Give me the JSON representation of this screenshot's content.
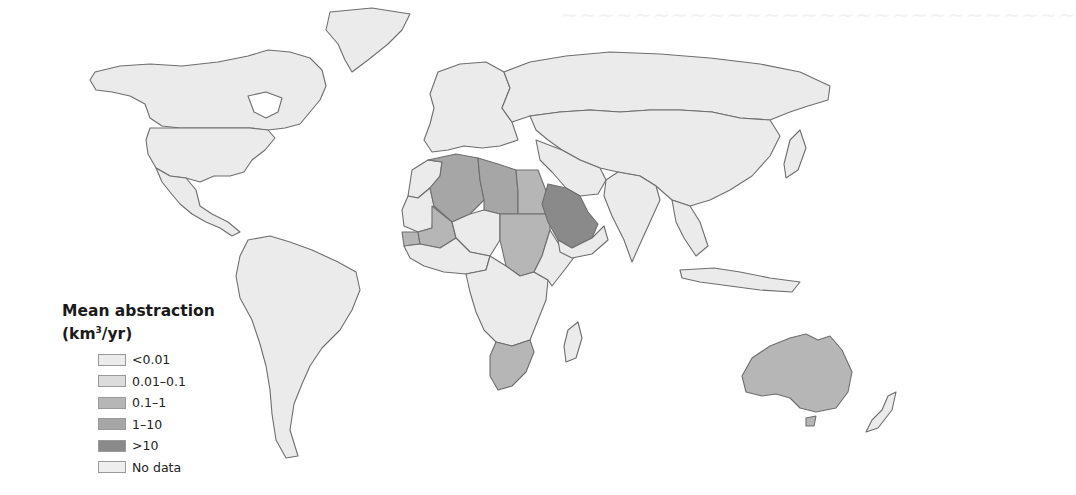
{
  "figure": {
    "type": "choropleth",
    "legend": {
      "title_line1": "Mean abstraction",
      "title_line2_prefix": "(km",
      "title_line2_sup": "3",
      "title_line2_suffix": "/yr)",
      "classes": [
        {
          "label": "<0.01",
          "color": "#ebebeb"
        },
        {
          "label": "0.01–0.1",
          "color": "#dcdcdc"
        },
        {
          "label": "0.1–1",
          "color": "#b6b6b6"
        },
        {
          "label": "1–10",
          "color": "#a6a6a6"
        },
        {
          "label": ">10",
          "color": "#8a8a8a"
        },
        {
          "label": "No data",
          "color": "#eeeeee"
        }
      ]
    },
    "regions": {
      "north_america": "<0.01",
      "greenland": "<0.01",
      "central_america": "<0.01",
      "south_america": "<0.01",
      "europe": "<0.01",
      "russia": "<0.01",
      "asia": "<0.01",
      "india": "<0.01",
      "southeast_asia": "<0.01",
      "morocco": "<0.01",
      "algeria": "1–10",
      "libya": "1–10",
      "egypt": "0.1–1",
      "sudan": "0.1–1",
      "mali": "0.1–1",
      "senegal": "0.1–1",
      "mauritania": "<0.01",
      "chad": "<0.01",
      "saudi_arabia": ">10",
      "yemen_oman_uae": "<0.01",
      "central_africa": "<0.01",
      "east_africa": "<0.01",
      "south_africa": "0.1–1",
      "madagascar": "<0.01",
      "australia": "0.1–1",
      "new_zealand": "<0.01"
    }
  }
}
